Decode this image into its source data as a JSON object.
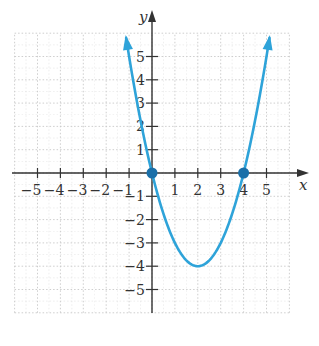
{
  "chart_data": {
    "type": "line",
    "title": "",
    "function": "y = x^2 - 4x",
    "xlabel": "x",
    "ylabel": "y",
    "xlim": [
      -6,
      6
    ],
    "ylim": [
      -6,
      6
    ],
    "grid": true,
    "grid_style": "dotted",
    "x_ticks": [
      -5,
      -4,
      -3,
      -2,
      -1,
      1,
      2,
      3,
      4,
      5
    ],
    "x_tick_labels": [
      "−5",
      "−4",
      "−3",
      "−2",
      "−1",
      "1",
      "2",
      "3",
      "4",
      "5"
    ],
    "y_ticks": [
      5,
      4,
      3,
      2,
      1,
      -1,
      -2,
      -3,
      -4,
      -5
    ],
    "y_tick_labels": [
      "5",
      "4",
      "3",
      "2",
      "1",
      "−1",
      "−2",
      "−3",
      "−4",
      "−5"
    ],
    "series": [
      {
        "name": "parabola",
        "color": "#2ea3d9",
        "x_range": [
          -1.13,
          5.13
        ],
        "vertex": [
          2,
          -4
        ],
        "arrows_at_ends": true
      }
    ],
    "highlighted_points": [
      {
        "x": 0,
        "y": 0,
        "label": "x-intercept"
      },
      {
        "x": 4,
        "y": 0,
        "label": "x-intercept"
      }
    ]
  },
  "colors": {
    "curve": "#2ea3d9",
    "point": "#1a6fa8",
    "axis": "#333333",
    "grid": "#c8c8c8"
  }
}
